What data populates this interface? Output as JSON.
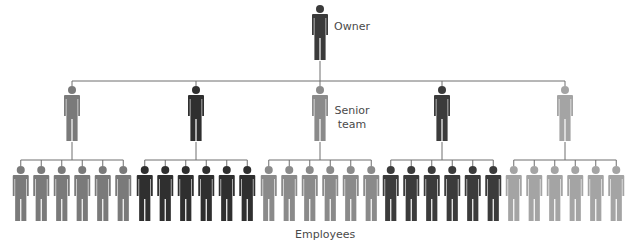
{
  "diagram": {
    "type": "organization-hierarchy",
    "labels": {
      "owner": "Owner",
      "senior_line1": "Senior",
      "senior_line2": "team",
      "employees": "Employees"
    },
    "colors": {
      "line": "#6e6e6e",
      "owner": "#3a3a3a",
      "group_1": "#7a7a7a",
      "group_2": "#2f2f2f",
      "group_3": "#8a8a8a",
      "group_4": "#3b3b3b",
      "group_5": "#a4a4a4"
    },
    "owner": {
      "x": 320,
      "color_key": "owner"
    },
    "senior_team": [
      {
        "x": 72,
        "color_key": "group_1",
        "employees": 6
      },
      {
        "x": 196,
        "color_key": "group_2",
        "employees": 6
      },
      {
        "x": 320,
        "color_key": "group_3",
        "employees": 6
      },
      {
        "x": 442,
        "color_key": "group_4",
        "employees": 6
      },
      {
        "x": 565,
        "color_key": "group_5",
        "employees": 6
      }
    ],
    "employee_spacing": 20.5
  }
}
